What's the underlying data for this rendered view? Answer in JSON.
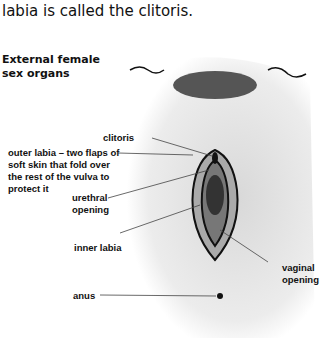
{
  "caption": "labia is called the clitoris.",
  "diagram": {
    "title": "External female sex organs",
    "labels": {
      "clitoris": "clitoris",
      "outer_labia": "outer labia – two flaps of soft skin that fold over the rest of the vulva to protect it",
      "urethral_opening": "urethral opening",
      "inner_labia": "inner labia",
      "vaginal_opening": "vaginal opening",
      "anus": "anus"
    }
  }
}
